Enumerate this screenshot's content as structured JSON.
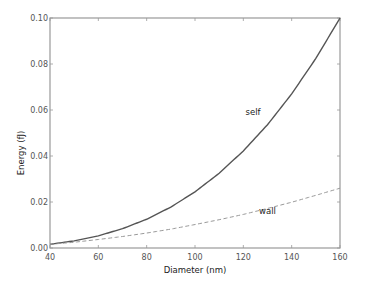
{
  "chart_data": {
    "type": "line",
    "title": "",
    "xlabel": "Diameter (nm)",
    "ylabel": "Energy (fJ)",
    "xlim": [
      40,
      160
    ],
    "ylim": [
      0.0,
      0.1
    ],
    "x_ticks": [
      "40",
      "60",
      "80",
      "100",
      "120",
      "140",
      "160"
    ],
    "y_ticks": [
      "0.00",
      "0.02",
      "0.04",
      "0.06",
      "0.08",
      "0.10"
    ],
    "grid": false,
    "legend": null,
    "x": [
      40,
      50,
      60,
      70,
      80,
      90,
      100,
      110,
      120,
      130,
      140,
      150,
      160
    ],
    "series": [
      {
        "name": "self",
        "style": "solid",
        "color": "#555555",
        "values": [
          0.0016,
          0.0031,
          0.0053,
          0.0084,
          0.0125,
          0.0178,
          0.0244,
          0.0325,
          0.0422,
          0.0536,
          0.067,
          0.0824,
          0.1
        ]
      },
      {
        "name": "wall",
        "style": "dashed",
        "color": "#999999",
        "values": [
          0.0016,
          0.0025,
          0.0037,
          0.005,
          0.0065,
          0.0082,
          0.0102,
          0.0123,
          0.0146,
          0.0172,
          0.0199,
          0.0229,
          0.026
        ]
      }
    ],
    "annotations": [
      {
        "text": "self",
        "x": 124,
        "y": 0.058
      },
      {
        "text": "wall",
        "x": 130,
        "y": 0.015
      }
    ]
  }
}
